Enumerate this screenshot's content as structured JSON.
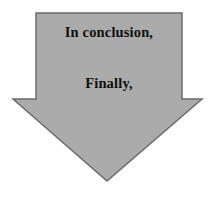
{
  "figure": {
    "type": "block-arrow-callout",
    "direction": "down",
    "background_color": "#FFFFFF",
    "shape": {
      "name": "down-arrow",
      "fill_color": "#ABABAB",
      "outline_color": "#6B6B6B",
      "outline_width": 1.5,
      "points": "36,13 182,13 182,99 202,99 107,181 13,99 36,99"
    },
    "text_color": "#100F0D",
    "lines": [
      {
        "text": "In conclusion,"
      },
      {
        "text": "Finally,"
      }
    ]
  }
}
